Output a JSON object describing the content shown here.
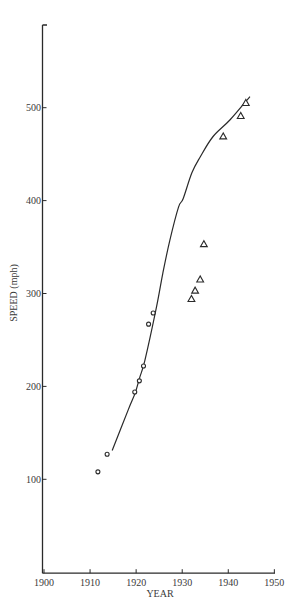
{
  "chart_data": {
    "type": "scatter",
    "title": "",
    "xlabel": "YEAR",
    "ylabel": "SPEED (mph)",
    "xlim": [
      1900,
      1950
    ],
    "ylim": [
      0,
      590
    ],
    "grid": false,
    "legend": null,
    "x_ticks": [
      1900,
      1910,
      1920,
      1930,
      1940,
      1950
    ],
    "y_ticks": [
      100,
      200,
      300,
      400,
      500
    ],
    "x_tick_labels": [
      "1900",
      "1910",
      "1920",
      "1930",
      "1940",
      "1950"
    ],
    "y_tick_labels": [
      "100",
      "200",
      "300",
      "400",
      "500"
    ],
    "series": [
      {
        "name": "circles",
        "marker": "circle",
        "points": [
          {
            "x": 1911.7,
            "y": 108
          },
          {
            "x": 1913.7,
            "y": 127
          },
          {
            "x": 1919.7,
            "y": 194
          },
          {
            "x": 1920.7,
            "y": 206
          },
          {
            "x": 1921.6,
            "y": 222
          },
          {
            "x": 1922.7,
            "y": 267
          },
          {
            "x": 1923.7,
            "y": 279
          }
        ]
      },
      {
        "name": "triangles",
        "marker": "triangle",
        "points": [
          {
            "x": 1932.0,
            "y": 294
          },
          {
            "x": 1932.8,
            "y": 303
          },
          {
            "x": 1933.9,
            "y": 315
          },
          {
            "x": 1934.7,
            "y": 353
          },
          {
            "x": 1938.9,
            "y": 469
          },
          {
            "x": 1942.7,
            "y": 491
          },
          {
            "x": 1943.8,
            "y": 505
          }
        ]
      },
      {
        "name": "trend-curve",
        "marker": "line",
        "points": [
          {
            "x": 1914.8,
            "y": 131
          },
          {
            "x": 1918.3,
            "y": 175
          },
          {
            "x": 1919.8,
            "y": 193
          },
          {
            "x": 1920.8,
            "y": 210
          },
          {
            "x": 1921.9,
            "y": 228
          },
          {
            "x": 1924.4,
            "y": 285
          },
          {
            "x": 1925.8,
            "y": 322
          },
          {
            "x": 1927.3,
            "y": 357
          },
          {
            "x": 1929.2,
            "y": 393
          },
          {
            "x": 1930.2,
            "y": 402
          },
          {
            "x": 1932.1,
            "y": 430
          },
          {
            "x": 1933.9,
            "y": 447
          },
          {
            "x": 1936.7,
            "y": 469
          },
          {
            "x": 1940.4,
            "y": 487
          },
          {
            "x": 1944.7,
            "y": 512
          }
        ]
      }
    ]
  },
  "layout": {
    "plot": {
      "x0_px": 44,
      "x_per_year": 4.607,
      "y0_px": 572.2,
      "y_per_unit": 0.929,
      "axis_top_px": 25,
      "axis_right_px": 275
    },
    "colors": {
      "ink": "#2a2a2a",
      "background": "#ffffff"
    }
  }
}
